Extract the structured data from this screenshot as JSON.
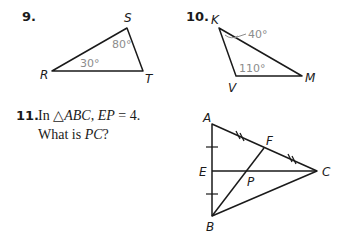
{
  "problems": [
    {
      "number": "9.",
      "vertices": {
        "R": "R",
        "S": "S",
        "T": "T"
      },
      "angles": {
        "R": "30°",
        "S": "80°"
      }
    },
    {
      "number": "10.",
      "vertices": {
        "K": "K",
        "V": "V",
        "M": "M"
      },
      "angles": {
        "K": "40°",
        "V": "110°"
      }
    },
    {
      "number": "11.",
      "text_line1_prefix": "In △",
      "text_line1_tri": "ABC",
      "text_line1_sep": ", ",
      "text_line1_seg": "EP",
      "text_line1_eq": " = 4.",
      "text_line2_prefix": "What is ",
      "text_line2_seg": "PC",
      "text_line2_suffix": "?",
      "vertices": {
        "A": "A",
        "B": "B",
        "C": "C",
        "E": "E",
        "F": "F",
        "P": "P"
      }
    }
  ]
}
